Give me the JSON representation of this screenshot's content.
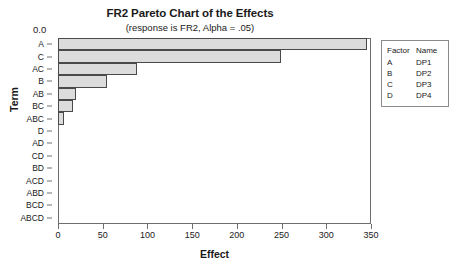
{
  "chart_data": {
    "type": "bar",
    "orientation": "horizontal",
    "title": "FR2 Pareto Chart of the Effects",
    "subtitle": "(response is FR2, Alpha = .05)",
    "xlabel": "Effect",
    "ylabel": "Term",
    "xlim": [
      0,
      350
    ],
    "xticks": [
      0,
      50,
      100,
      150,
      200,
      250,
      300,
      350
    ],
    "xtick_labels": [
      "0",
      "50",
      "100",
      "150",
      "200",
      "250",
      "300",
      "350"
    ],
    "grid": false,
    "categories": [
      "A",
      "C",
      "AC",
      "B",
      "AB",
      "BC",
      "ABC",
      "D",
      "AD",
      "CD",
      "BD",
      "ACD",
      "ABD",
      "BCD",
      "ABCD"
    ],
    "values": [
      345,
      249,
      88,
      55,
      20,
      17,
      7,
      0,
      0,
      0,
      0,
      0,
      0,
      0,
      0
    ],
    "reference_line": {
      "label": "0.0",
      "value": 0
    },
    "bar_fill_color": "#dcdcdc",
    "bar_edge_color": "#4a4a4a",
    "background_color": "#ffffff",
    "legend": {
      "position": "right",
      "headers": [
        "Factor",
        "Name"
      ],
      "rows": [
        {
          "factor": "A",
          "name": "DP1"
        },
        {
          "factor": "B",
          "name": "DP2"
        },
        {
          "factor": "C",
          "name": "DP3"
        },
        {
          "factor": "D",
          "name": "DP4"
        }
      ]
    }
  }
}
